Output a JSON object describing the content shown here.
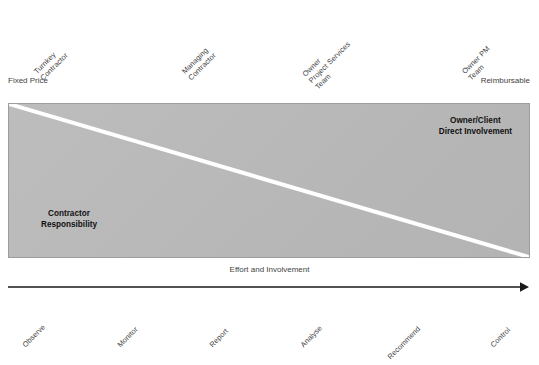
{
  "diagram": {
    "colors": {
      "band_fill": "#b9b9b9",
      "band_border": "#9d9d9d",
      "divider_line": "#ffffff",
      "text": "#3f3f3f",
      "bold_text": "#111111",
      "axis": "#1a1a1a"
    },
    "top_axis": {
      "left_caption": "Fixed Price",
      "right_caption": "Reimbursable",
      "labels": [
        {
          "lines": [
            "Turnkey",
            "Contractor"
          ],
          "x": 45,
          "y": 64
        },
        {
          "lines": [
            "Managing",
            "Contractor"
          ],
          "x": 193,
          "y": 64
        },
        {
          "lines": [
            "Owner",
            "Project Services",
            "Team"
          ],
          "x": 320,
          "y": 64
        },
        {
          "lines": [
            "Owner PM",
            "Team"
          ],
          "x": 473,
          "y": 64
        }
      ]
    },
    "band": {
      "lower_left_caption": {
        "lines": [
          "Contractor",
          "Responsibility"
        ]
      },
      "upper_right_caption": {
        "lines": [
          "Owner/Client",
          "Direct Involvement"
        ]
      },
      "divider": {
        "from": [
          0,
          0
        ],
        "to": [
          522,
          155
        ],
        "stroke_width": 4
      }
    },
    "bottom_axis": {
      "caption": "Effort and Involvement",
      "arrow_direction": "right",
      "labels": [
        {
          "lines": [
            "Observe"
          ],
          "x": 27,
          "y": 340
        },
        {
          "lines": [
            "Monitor"
          ],
          "x": 122,
          "y": 340
        },
        {
          "lines": [
            "Report"
          ],
          "x": 214,
          "y": 340
        },
        {
          "lines": [
            "Analyse"
          ],
          "x": 305,
          "y": 340
        },
        {
          "lines": [
            "Recommend"
          ],
          "x": 392,
          "y": 349
        },
        {
          "lines": [
            "Control"
          ],
          "x": 495,
          "y": 340
        }
      ]
    }
  }
}
